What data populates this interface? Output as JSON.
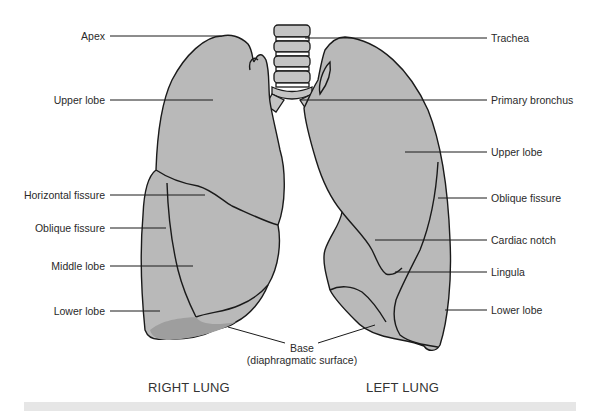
{
  "diagram": {
    "colors": {
      "lung_fill": "#b9b9b9",
      "outline": "#1a1a1a",
      "background": "#ffffff",
      "label_text": "#2a2a2a"
    },
    "right_lung": {
      "caption": "RIGHT LUNG",
      "labels": {
        "apex": "Apex",
        "upper_lobe": "Upper lobe",
        "horizontal_fissure": "Horizontal fissure",
        "oblique_fissure": "Oblique fissure",
        "middle_lobe": "Middle lobe",
        "lower_lobe": "Lower lobe"
      }
    },
    "left_lung": {
      "caption": "LEFT LUNG",
      "labels": {
        "trachea": "Trachea",
        "primary_bronchus": "Primary bronchus",
        "upper_lobe": "Upper lobe",
        "oblique_fissure": "Oblique fissure",
        "cardiac_notch": "Cardiac notch",
        "lingula": "Lingula",
        "lower_lobe": "Lower lobe"
      }
    },
    "base": {
      "line1": "Base",
      "line2": "(diaphragmatic surface)"
    }
  }
}
